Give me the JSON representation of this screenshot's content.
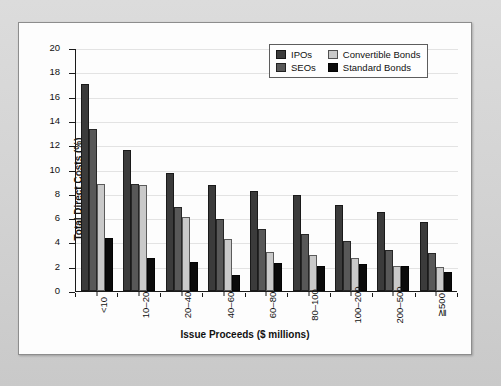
{
  "chart_data": {
    "type": "bar",
    "title": "",
    "xlabel": "Issue Proceeds ($ millions)",
    "ylabel": "Total Direct Costs (%)",
    "ylim": [
      0,
      20
    ],
    "ytick_step": 2,
    "yticks": [
      "20",
      "18",
      "16",
      "14",
      "12",
      "10",
      "8",
      "6",
      "4",
      "2",
      "0"
    ],
    "grid": true,
    "legend_position": "top-right",
    "categories": [
      "<10",
      "10–20",
      "20–40",
      "40–60",
      "60–80",
      "80–100",
      "100–200",
      "200–500",
      "≧500"
    ],
    "series": [
      {
        "name": "IPOs",
        "color": "#3b3b3b",
        "values": [
          17.0,
          11.6,
          9.7,
          8.7,
          8.2,
          7.9,
          7.1,
          6.5,
          5.7
        ]
      },
      {
        "name": "SEOs",
        "color": "#585858",
        "values": [
          13.3,
          8.8,
          6.9,
          5.9,
          5.1,
          4.7,
          4.1,
          3.4,
          3.1
        ]
      },
      {
        "name": "Convertible Bonds",
        "color": "#c9c9c9",
        "values": [
          8.8,
          8.7,
          6.1,
          4.3,
          3.2,
          3.0,
          2.7,
          2.1,
          2.0
        ]
      },
      {
        "name": "Standard Bonds",
        "color": "#0b0b0b",
        "values": [
          4.4,
          2.7,
          2.4,
          1.3,
          2.3,
          2.1,
          2.2,
          2.1,
          1.6
        ]
      }
    ]
  },
  "colors": {
    "page_background": "#d4d4d4",
    "panel_background": "#fdfdfd",
    "axis": "#1a1a1a",
    "grid": "#aaaaaa"
  }
}
